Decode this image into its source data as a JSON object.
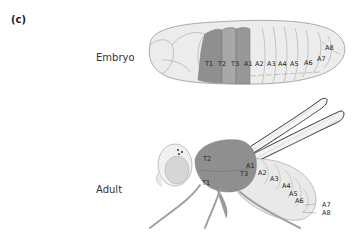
{
  "panel_label": "(c)",
  "embryo": {
    "label": "Embryo",
    "thoracic_segments": [
      "T1",
      "T2",
      "T3"
    ],
    "abdominal_segments": [
      "A1",
      "A2",
      "A3",
      "A4",
      "A5",
      "A6",
      "A7",
      "A8"
    ]
  },
  "adult": {
    "label": "Adult",
    "thoracic_segments": [
      "T1",
      "T2",
      "T3"
    ],
    "abdominal_segments": [
      "A1",
      "A2",
      "A3",
      "A4",
      "A5",
      "A6",
      "A7",
      "A8"
    ]
  },
  "colors": {
    "thorax_dark": "#8f8f8f",
    "thorax_mid": "#a5a5a5",
    "body_light": "#e6e6e6",
    "outline": "#888888"
  }
}
